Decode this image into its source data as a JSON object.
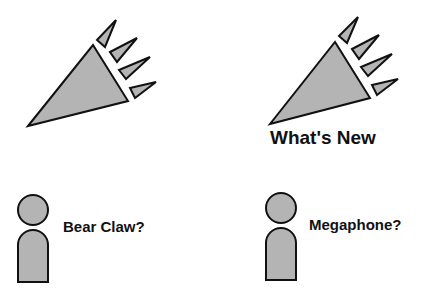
{
  "panels": [
    {
      "id": "left-top",
      "icon": "megaphone-claw-icon",
      "caption": ""
    },
    {
      "id": "right-top",
      "icon": "megaphone-icon",
      "caption": "What's New"
    },
    {
      "id": "left-bottom",
      "icon": "person-icon",
      "label": "Bear Claw?"
    },
    {
      "id": "right-bottom",
      "icon": "person-icon",
      "label": "Megaphone?"
    }
  ],
  "colors": {
    "fill": "#b4b4b4",
    "stroke": "#111111"
  }
}
